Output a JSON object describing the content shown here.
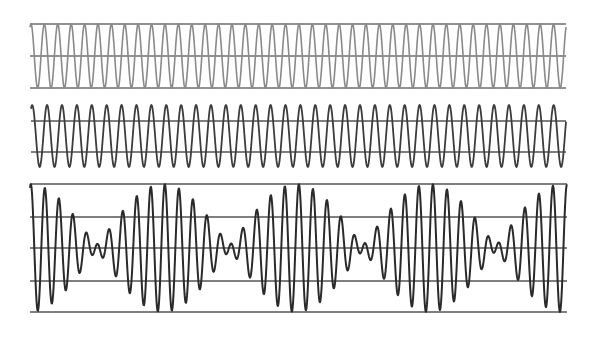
{
  "chart_data": [
    {
      "type": "line",
      "title": "",
      "name": "pure-sine-wave-1",
      "description": "Pure sinusoid, higher frequency",
      "x_range_px": [
        30,
        566
      ],
      "center_y": 56,
      "amplitude": 32,
      "period_px": 13.4,
      "phase_start": -0.45,
      "color": "#8a8a8a",
      "stroke_width": 1.6,
      "reference_lines_y": [
        24,
        56,
        88
      ],
      "reference_color": "#6e6e6e",
      "grid": true,
      "legend": null
    },
    {
      "type": "line",
      "title": "",
      "name": "pure-sine-wave-2",
      "description": "Pure sinusoid, slightly lower frequency",
      "x_range_px": [
        31,
        566
      ],
      "center_y": 136,
      "amplitude": 31,
      "period_px": 14.9,
      "phase_start": -0.5,
      "color": "#3c3c3c",
      "stroke_width": 1.8,
      "reference_lines_y": [
        121,
        152
      ],
      "reference_color": "#555555",
      "grid": true,
      "legend": null
    },
    {
      "type": "line",
      "title": "",
      "name": "beat-superposition",
      "description": "Sum of the two sinusoids showing beats",
      "x_range_px": [
        30,
        567
      ],
      "center_y": 248,
      "components": [
        {
          "amplitude": 34,
          "period_px": 13.4
        },
        {
          "amplitude": 30,
          "period_px": 14.9
        }
      ],
      "beat_period_px": 134,
      "envelope_minima_x": [
        97,
        230,
        365,
        500
      ],
      "color": "#2a2a2a",
      "stroke_width": 2,
      "reference_lines_y": [
        184,
        217,
        248,
        281,
        312
      ],
      "reference_color": "#555555",
      "grid": true,
      "legend": null
    }
  ]
}
